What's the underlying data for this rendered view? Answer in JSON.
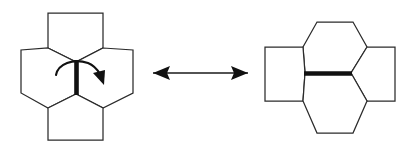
{
  "figure": {
    "background_color": "#ffffff",
    "line_color": "#2b2b2b",
    "bond_color": "#111111",
    "width": 409,
    "height": 148
  },
  "left_panel": {
    "name": "before-rotation-tiling",
    "description": "Pyracylene patch: two pentagons top and bottom, two hexagons left and right, vertical central bond",
    "central_bond_orientation": "vertical",
    "faces": [
      {
        "id": "top-pentagon",
        "sides": 5,
        "label": "pentagon",
        "points": "48,13 103,13 103,48 76,62 48,48"
      },
      {
        "id": "left-hexagon",
        "sides": 6,
        "label": "hexagon",
        "points": "48,48 76,62 76,94 48,108 21,93 21,50"
      },
      {
        "id": "right-hexagon",
        "sides": 6,
        "label": "hexagon",
        "points": "103,48 133,50 133,93 103,108 76,94 76,62"
      },
      {
        "id": "bottom-pentagon",
        "sides": 5,
        "label": "pentagon",
        "points": "48,108 76,94 103,108 103,140 48,140"
      }
    ],
    "central_bond": {
      "id": "rotating-bond-vertical",
      "x1": 76.5,
      "y1": 60,
      "x2": 76.5,
      "y2": 95
    },
    "rotation_arrow": {
      "id": "rotation-curved-arrow",
      "direction": "clockwise",
      "path": "M 56,75 C 58,64 73,58 88,63 C 93,65 97,69 100,74",
      "head_points": "104,85 93,73 105,70"
    }
  },
  "right_panel": {
    "name": "after-rotation-tiling",
    "description": "Same patch rotated: two hexagons top and bottom, two pentagons left and right, horizontal central bond",
    "central_bond_orientation": "horizontal",
    "faces": [
      {
        "id": "top-hexagon",
        "sides": 6,
        "label": "hexagon",
        "points": "303,47 317,22 353,22 367,47 351,73 305,73"
      },
      {
        "id": "left-pentagon",
        "sides": 5,
        "label": "pentagon",
        "points": "265,47 303,47 305,73 303,101 265,101"
      },
      {
        "id": "right-pentagon",
        "sides": 5,
        "label": "pentagon",
        "points": "367,47 395,47 395,101 367,101 351,73"
      },
      {
        "id": "bottom-hexagon",
        "sides": 6,
        "label": "hexagon",
        "points": "305,73 351,73 367,101 353,133 317,133 303,101"
      }
    ],
    "central_bond": {
      "id": "rotating-bond-horizontal",
      "x1": 304,
      "y1": 73.5,
      "x2": 352,
      "y2": 73.5
    }
  },
  "equivalence_arrow": {
    "name": "double-headed-equivalence-arrow",
    "symbol": "double-arrow-icon",
    "direction": "bidirectional",
    "x1": 153,
    "x2": 248,
    "y": 73,
    "left_head_points": "153,73 170,66 167,73 170,80",
    "right_head_points": "248,73 231,66 234,73 231,80"
  }
}
